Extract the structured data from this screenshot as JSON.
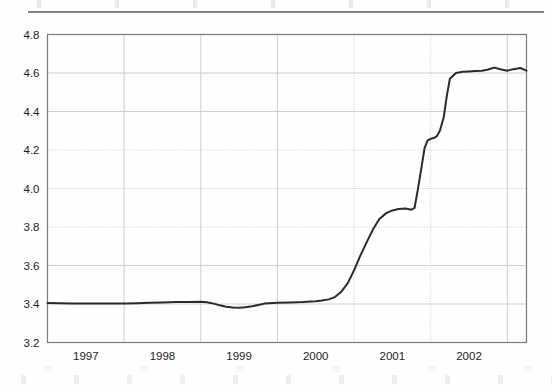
{
  "page": {
    "has_top_rule": true,
    "background_color": "#fefefe"
  },
  "chart_data": {
    "type": "line",
    "title": "",
    "subtitle": "",
    "xlabel": "",
    "ylabel": "",
    "xlim": [
      1996.5,
      2002.75
    ],
    "ylim": [
      3.2,
      4.8
    ],
    "grid": true,
    "legend": false,
    "legend_position": "none",
    "line_color": "#2b2b2d",
    "line_width": 2.0,
    "grid_color": "#c9c9cc",
    "axis_color": "#7a7a7d",
    "y_ticks": [
      "4.8",
      "4.6",
      "4.4",
      "4.2",
      "4.0",
      "3.8",
      "3.6",
      "3.4",
      "3.2"
    ],
    "y_tick_values": [
      4.8,
      4.6,
      4.4,
      4.2,
      4.0,
      3.8,
      3.6,
      3.4,
      3.2
    ],
    "x_ticks": [
      "1997",
      "1998",
      "1999",
      "2000",
      "2001",
      "2002"
    ],
    "x_tick_values": [
      1997.0,
      1998.0,
      1999.0,
      2000.0,
      2001.0,
      2002.0
    ],
    "x_gridline_values": [
      1997.5,
      1998.5,
      1999.5,
      2000.5,
      2001.5,
      2002.5
    ],
    "series": [
      {
        "name": "series-1",
        "x": [
          1996.5,
          1996.67,
          1996.83,
          1997.0,
          1997.17,
          1997.33,
          1997.5,
          1997.67,
          1997.83,
          1998.0,
          1998.17,
          1998.33,
          1998.5,
          1998.58,
          1998.67,
          1998.75,
          1998.83,
          1998.92,
          1999.0,
          1999.08,
          1999.17,
          1999.25,
          1999.33,
          1999.5,
          1999.67,
          1999.83,
          2000.0,
          2000.08,
          2000.17,
          2000.25,
          2000.33,
          2000.42,
          2000.5,
          2000.58,
          2000.67,
          2000.75,
          2000.83,
          2000.92,
          2001.0,
          2001.08,
          2001.17,
          2001.25,
          2001.29,
          2001.33,
          2001.38,
          2001.42,
          2001.46,
          2001.5,
          2001.54,
          2001.58,
          2001.62,
          2001.67,
          2001.71,
          2001.75,
          2001.83,
          2001.92,
          2002.0,
          2002.08,
          2002.17,
          2002.25,
          2002.33,
          2002.42,
          2002.5,
          2002.58,
          2002.67,
          2002.75
        ],
        "y": [
          3.405,
          3.404,
          3.403,
          3.403,
          3.402,
          3.402,
          3.403,
          3.404,
          3.406,
          3.408,
          3.41,
          3.411,
          3.412,
          3.409,
          3.402,
          3.393,
          3.386,
          3.382,
          3.381,
          3.383,
          3.388,
          3.395,
          3.402,
          3.406,
          3.408,
          3.41,
          3.414,
          3.418,
          3.424,
          3.436,
          3.462,
          3.51,
          3.575,
          3.65,
          3.725,
          3.79,
          3.842,
          3.872,
          3.886,
          3.893,
          3.896,
          3.89,
          3.9,
          3.99,
          4.11,
          4.21,
          4.25,
          4.258,
          4.262,
          4.272,
          4.3,
          4.37,
          4.48,
          4.57,
          4.6,
          4.606,
          4.608,
          4.61,
          4.612,
          4.618,
          4.628,
          4.618,
          4.612,
          4.62,
          4.626,
          4.612
        ]
      }
    ]
  }
}
